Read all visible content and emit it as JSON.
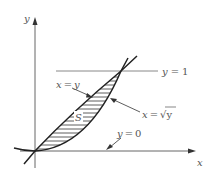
{
  "diagram": {
    "type": "region-between-curves",
    "axes": {
      "x_label": "x",
      "y_label": "y"
    },
    "curves": [
      {
        "name": "line",
        "equation_lhs": "x",
        "equation_rhs": "y",
        "label": "x = y"
      },
      {
        "name": "root",
        "equation_lhs": "x",
        "equation_rhs": "√y",
        "label": "x = √y"
      }
    ],
    "horizontal_lines": [
      {
        "label": "y = 1",
        "lhs": "y",
        "rhs": "1"
      },
      {
        "label": "y = 0",
        "lhs": "y",
        "rhs": "0"
      }
    ],
    "region_label": "S",
    "colors": {
      "line": "#333333",
      "axis": "#555555",
      "hline": "#888888",
      "hatch": "#333333"
    }
  }
}
